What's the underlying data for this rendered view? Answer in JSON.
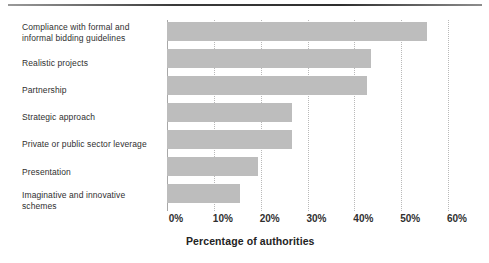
{
  "chart_data": {
    "type": "bar",
    "orientation": "horizontal",
    "title": "",
    "xlabel": "Percentage of authorities",
    "ylabel": "",
    "xlim": [
      0,
      60
    ],
    "grid": true,
    "legend": null,
    "categories": [
      "Compliance with formal and informal bidding guidelines",
      "Realistic projects",
      "Partnership",
      "Strategic approach",
      "Private or public sector leverage",
      "Presentation",
      "Imaginative and innovative schemes"
    ],
    "category_lines": [
      [
        "Compliance with formal and",
        "informal bidding guidelines"
      ],
      [
        "Realistic projects"
      ],
      [
        "Partnership"
      ],
      [
        "Strategic approach"
      ],
      [
        "Private or public sector leverage"
      ],
      [
        "Presentation"
      ],
      [
        "Imaginative and innovative",
        "schemes"
      ]
    ],
    "values": [
      55.6,
      43.6,
      42.7,
      26.7,
      26.7,
      19.4,
      15.6
    ],
    "xticks": [
      0,
      10,
      20,
      30,
      40,
      50,
      60
    ],
    "xtick_labels": [
      "0%",
      "10%",
      "20%",
      "30%",
      "40%",
      "50%",
      "60%"
    ],
    "bar_color": "#bdbdbd",
    "gridline_color": "#b9b9b9",
    "axis_color": "#a8a8a8"
  }
}
